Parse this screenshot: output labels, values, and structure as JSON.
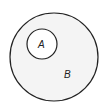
{
  "diagram": {
    "type": "euler",
    "title": "",
    "sets": [
      {
        "id": "B",
        "label": "B",
        "cx": 54,
        "cy": 57,
        "r": 44,
        "fill": "#f4f4f4",
        "stroke": "#222222"
      },
      {
        "id": "A",
        "label": "A",
        "cx": 42,
        "cy": 44,
        "r": 15,
        "fill": "#ffffff",
        "stroke": "#222222"
      }
    ],
    "relationship": "A is a subset of B"
  }
}
